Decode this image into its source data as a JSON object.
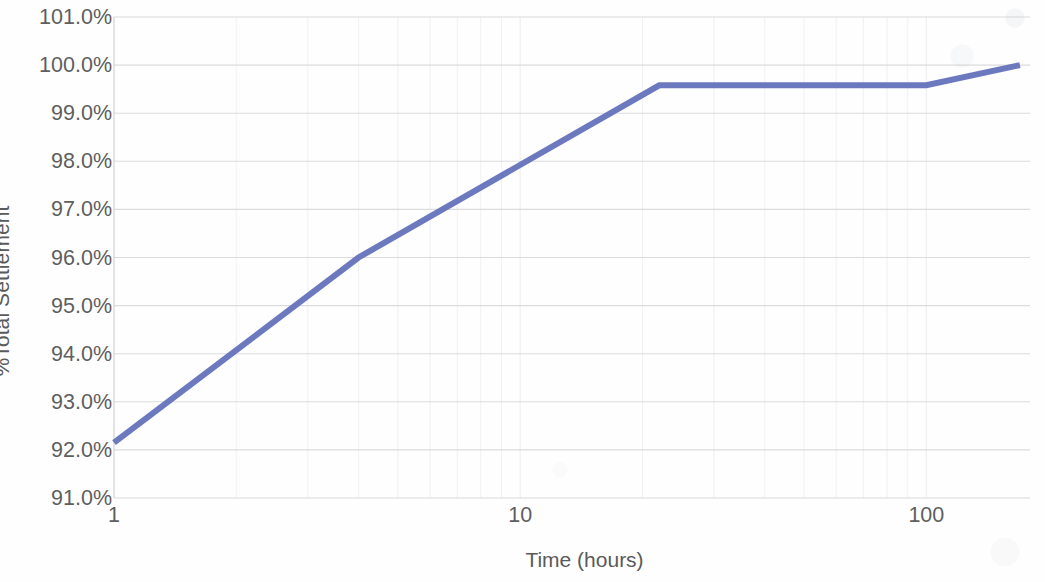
{
  "chart_data": {
    "type": "line",
    "title": "",
    "subtitle": "",
    "xlabel": "Time (hours)",
    "ylabel": "%Total Settlement",
    "xscale": "log",
    "yscale": "linear",
    "xlim": [
      1,
      180
    ],
    "ylim": [
      91.0,
      101.0
    ],
    "grid": "both",
    "legend": "none",
    "x_tick_labels": [
      "1",
      "10",
      "100"
    ],
    "x_ticks": [
      1,
      10,
      100
    ],
    "y_tick_labels": [
      "101.0%",
      "100.0%",
      "99.0%",
      "98.0%",
      "97.0%",
      "96.0%",
      "95.0%",
      "94.0%",
      "93.0%",
      "92.0%",
      "91.0%"
    ],
    "y_ticks": [
      101.0,
      100.0,
      99.0,
      98.0,
      97.0,
      96.0,
      95.0,
      94.0,
      93.0,
      92.0,
      91.0
    ],
    "series": [
      {
        "name": "Settlement",
        "color": "#6572BC",
        "line_width": 6,
        "x": [
          1.0,
          4.0,
          22.0,
          100.0,
          170.0
        ],
        "y": [
          92.15,
          96.0,
          99.58,
          99.58,
          100.0
        ]
      }
    ],
    "annotations": []
  },
  "axis": {
    "y_title": "%Total Settlement",
    "x_title": "Time (hours)"
  },
  "colors": {
    "series_line": "#6572BC",
    "gridline": "#d6d6d6",
    "gridline_minor": "#ededed",
    "axis_line": "#bfbfbf",
    "tick_text": "#5e5e5e",
    "title_text": "#5a5a5a",
    "background": "#fefefe"
  }
}
